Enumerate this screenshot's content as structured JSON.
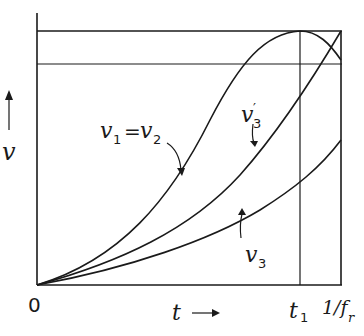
{
  "diagram": {
    "type": "plot-sketch",
    "axes": {
      "y_label": "v",
      "y_arrow": "up-arrow",
      "x_label": "t",
      "x_arrow": "right-arrow",
      "origin_label": "0"
    },
    "x_markers": [
      {
        "label": "t",
        "subscript": "1"
      },
      {
        "label": "1/f",
        "subscript": "r"
      }
    ],
    "curves": [
      {
        "id": "v1-v2",
        "label": "v₁ = v₂",
        "main": "v",
        "sub1": "1",
        "eq": "=",
        "main2": "v",
        "sub2": "2",
        "shape": "rises to maximum at t1 then decreases"
      },
      {
        "id": "v3-prime",
        "label": "v₃′",
        "main": "v",
        "sup": "′",
        "sub": "3",
        "shape": "rises, reaching top level at 1/fr"
      },
      {
        "id": "v3",
        "label": "v₃",
        "main": "v",
        "sub": "3",
        "shape": "rises slowly"
      }
    ],
    "horizontal_levels": [
      "maximum level",
      "secondary level"
    ]
  }
}
